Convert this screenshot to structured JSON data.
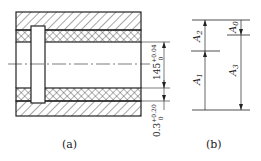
{
  "figure_a": {
    "caption": "(a)",
    "dimension_upper": {
      "nominal": "145",
      "upper_dev": "+0.04",
      "lower_dev": "0"
    },
    "dimension_lower": {
      "nominal": "0.3",
      "upper_dev": "+0.20",
      "lower_dev": "0"
    }
  },
  "figure_b": {
    "caption": "(b)",
    "labels": [
      "A1",
      "A2",
      "A3",
      "A0"
    ]
  },
  "colors": {
    "line": "#222222",
    "background": "#ffffff"
  }
}
